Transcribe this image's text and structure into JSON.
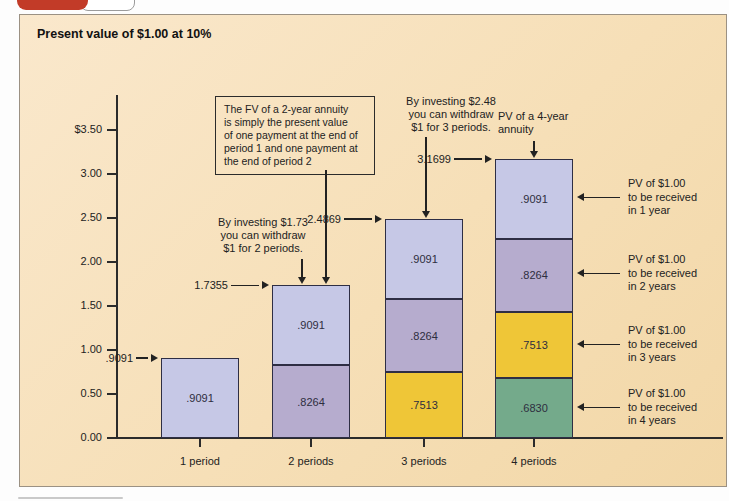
{
  "panel": {
    "title": "Present value of $1.00 at 10%"
  },
  "colors": {
    "lavender": "#c6c8e6",
    "mauve": "#b6acce",
    "yellow": "#efc637",
    "green": "#74aa8b",
    "tab_red": "#c23b28",
    "panel_bg": "#f6dfb7",
    "line": "#2b2b2b"
  },
  "chart_data": {
    "type": "bar",
    "stacked": true,
    "title": "Present value of $1.00 at 10%",
    "xlabel": "",
    "ylabel": "",
    "ylim": [
      0,
      3.5
    ],
    "grid": false,
    "x_categories": [
      "1 period",
      "2 periods",
      "3 periods",
      "4 periods"
    ],
    "y_axis": {
      "tick_labels": [
        "$3.50",
        "3.00",
        "2.50",
        "2.00",
        "1.50",
        "1.00",
        "0.50",
        "0.00"
      ],
      "min": 0,
      "max": 3.5,
      "step": 0.5
    },
    "bars": [
      {
        "category": "1 period",
        "total": 0.9091,
        "total_label": ".9091",
        "segments": [
          {
            "label": ".9091",
            "value": 0.9091,
            "color_key": "lavender"
          }
        ]
      },
      {
        "category": "2 periods",
        "total": 1.7355,
        "total_label": "1.7355",
        "segments": [
          {
            "label": ".8264",
            "value": 0.8264,
            "color_key": "mauve"
          },
          {
            "label": ".9091",
            "value": 0.9091,
            "color_key": "lavender"
          }
        ]
      },
      {
        "category": "3 periods",
        "total": 2.4869,
        "total_label": "2.4869",
        "segments": [
          {
            "label": ".7513",
            "value": 0.7513,
            "color_key": "yellow"
          },
          {
            "label": ".8264",
            "value": 0.8264,
            "color_key": "mauve"
          },
          {
            "label": ".9091",
            "value": 0.9091,
            "color_key": "lavender"
          }
        ]
      },
      {
        "category": "4 periods",
        "total": 3.1699,
        "total_label": "3.1699",
        "segments": [
          {
            "label": ".6830",
            "value": 0.683,
            "color_key": "green"
          },
          {
            "label": ".7513",
            "value": 0.7513,
            "color_key": "yellow"
          },
          {
            "label": ".8264",
            "value": 0.8264,
            "color_key": "mauve"
          },
          {
            "label": ".9091",
            "value": 0.9091,
            "color_key": "lavender"
          }
        ]
      }
    ],
    "annotations": [
      {
        "id": "fv-2yr-box",
        "text": "The FV of a 2-year annuity\nis simply the present value\nof one payment at the end of\nperiod 1 and one payment at\nthe end of period 2",
        "boxed": true
      },
      {
        "id": "invest-173",
        "text": "By investing $1.73\nyou can withdraw\n$1 for 2 periods."
      },
      {
        "id": "invest-248",
        "text": "By investing $2.48\nyou can withdraw\n$1 for 3 periods."
      },
      {
        "id": "pv-4yr-annuity",
        "text": "PV of a 4-year\nannuity"
      }
    ],
    "right_labels": [
      "PV of $1.00\nto be received\nin 1 year",
      "PV of $1.00\nto be received\nin 2 years",
      "PV of $1.00\nto be received\nin 3 years",
      "PV of $1.00\nto be received\nin 4 years"
    ]
  }
}
